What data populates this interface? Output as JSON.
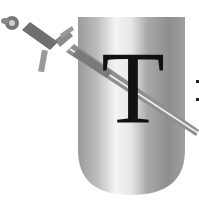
{
  "emblem": {
    "letter": "T",
    "shield_colors": {
      "light": "#f2f2f2",
      "mid": "#b8b8b8",
      "dark": "#8a8a8a"
    },
    "sword_color": "#8f8f8f",
    "sword_highlight": "#eeeeee",
    "letter_color": "#111111"
  }
}
